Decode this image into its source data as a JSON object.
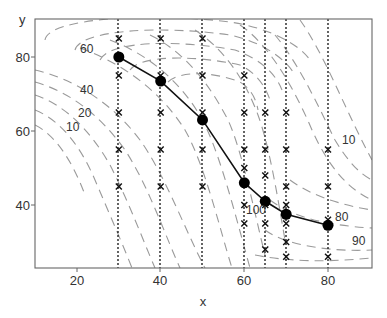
{
  "chart_data": {
    "type": "line",
    "title": "",
    "xlabel": "x",
    "ylabel": "y",
    "xlim": [
      10,
      92
    ],
    "ylim": [
      22,
      87
    ],
    "xticks": [
      20,
      40,
      60,
      80
    ],
    "yticks": [
      40,
      60,
      80
    ],
    "grid": false,
    "legend": null,
    "series": [
      {
        "name": "path",
        "style": "solid line with filled circle markers",
        "x": [
          30,
          40,
          50,
          60,
          65,
          70,
          80
        ],
        "y": [
          80,
          73.5,
          63,
          46,
          41,
          37.5,
          34.5
        ]
      }
    ],
    "sample_columns": [
      {
        "x": 30,
        "y": [
          85,
          75,
          65,
          55,
          45
        ]
      },
      {
        "x": 40,
        "y": [
          85,
          75,
          65,
          55,
          45
        ]
      },
      {
        "x": 50,
        "y": [
          85,
          75,
          65,
          55,
          45
        ]
      },
      {
        "x": 60,
        "y": [
          75,
          65,
          55,
          50,
          40,
          35
        ]
      },
      {
        "x": 65,
        "y": [
          65,
          55,
          48,
          40,
          35,
          28
        ]
      },
      {
        "x": 70,
        "y": [
          65,
          55,
          45,
          40,
          35,
          30,
          26
        ]
      },
      {
        "x": 80,
        "y": [
          55,
          45,
          36,
          26
        ]
      }
    ],
    "contour_labels": [
      {
        "text": "60",
        "x": 24,
        "y": 77
      },
      {
        "text": "40",
        "x": 24,
        "y": 68
      },
      {
        "text": "20",
        "x": 22,
        "y": 62
      },
      {
        "text": "10",
        "x": 18,
        "y": 58.5
      },
      {
        "text": "10",
        "x": 87,
        "y": 52
      },
      {
        "text": "100",
        "x": 63,
        "y": 40
      },
      {
        "text": "80",
        "x": 84,
        "y": 36.5
      },
      {
        "text": "90",
        "x": 87,
        "y": 32
      }
    ]
  },
  "axes": {
    "xlabel": "x",
    "ylabel": "y",
    "xtick_labels": [
      "20",
      "40",
      "60",
      "80"
    ],
    "ytick_labels": [
      "80",
      "60",
      "40"
    ]
  },
  "contour_text": {
    "c60": "60",
    "c40": "40",
    "c20": "20",
    "c10a": "10",
    "c10b": "10",
    "c100": "100",
    "c80": "80",
    "c90": "90"
  }
}
